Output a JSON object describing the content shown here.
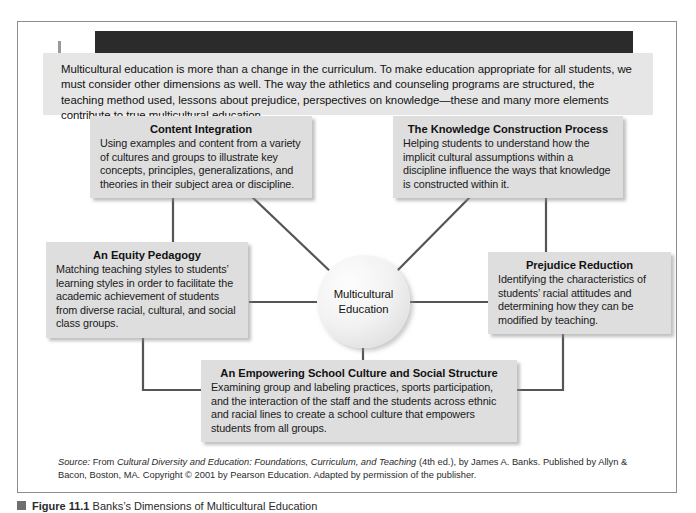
{
  "figure": {
    "intro_paragraph": "Multicultural education is more than a change in the curriculum. To make education appropriate for all students, we must consider other dimensions as well. The way the athletics and counseling programs are structured, the teaching method used, lessons about prejudice, perspectives on knowledge—these and many more elements contribute to true multicultural education.",
    "center_label_line1": "Multicultural",
    "center_label_line2": "Education",
    "boxes": [
      {
        "id": "content-integration",
        "title": "Content Integration",
        "body": "Using examples and content from a variety of cultures and groups to illustrate key concepts, principles, generalizations, and theories in their subject area or discipline."
      },
      {
        "id": "knowledge-construction",
        "title": "The Knowledge Construction Process",
        "body": "Helping students to understand how the implicit cultural assumptions within a discipline influence the ways that knowledge is constructed within it."
      },
      {
        "id": "equity-pedagogy",
        "title": "An Equity Pedagogy",
        "body": "Matching teaching styles to students’ learning styles in order to facilitate the academic achievement of students from diverse racial, cultural, and social class groups."
      },
      {
        "id": "prejudice-reduction",
        "title": "Prejudice Reduction",
        "body": "Identifying the characteristics of students’ racial attitudes and determining how they can be modified by teaching."
      },
      {
        "id": "empowering-culture",
        "title": "An Empowering School Culture and Social Structure",
        "body": "Examining group and labeling practices, sports participation, and the interaction of the staff and the students across ethnic and racial lines to create a school culture that empowers students from all groups."
      }
    ],
    "source": {
      "label": "Source:",
      "lead": " From ",
      "work_title": "Cultural Diversity and Education: Foundations, Curriculum, and Teaching",
      "rest": " (4th ed.), by James A. Banks. Published by Allyn & Bacon, Boston, MA. Copyright © 2001 by Pearson Education. Adapted by permission of the publisher."
    },
    "caption": {
      "label": "Figure",
      "number": "11.1",
      "text": "Banks’s Dimensions of Multicultural Education"
    },
    "colors": {
      "box_fill": "#dedede",
      "intro_fill": "#e6e6e6",
      "connector": "#555555",
      "frame_border": "#8c8c8c",
      "top_bar": "#2b2b2b"
    }
  }
}
